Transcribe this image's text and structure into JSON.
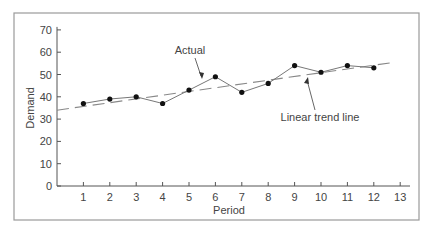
{
  "chart_data": {
    "type": "line",
    "title": "",
    "xlabel": "Period",
    "ylabel": "Demand",
    "xlim": [
      0,
      13
    ],
    "ylim": [
      0,
      70
    ],
    "x_ticks": [
      1,
      2,
      3,
      4,
      5,
      6,
      7,
      8,
      9,
      10,
      11,
      12,
      13
    ],
    "y_ticks": [
      0,
      10,
      20,
      30,
      40,
      50,
      60,
      70
    ],
    "grid": false,
    "legend": null,
    "series": [
      {
        "name": "Actual",
        "style": "solid-with-markers",
        "x": [
          1,
          2,
          3,
          4,
          5,
          6,
          7,
          8,
          9,
          10,
          11,
          12
        ],
        "values": [
          37,
          39,
          40,
          37,
          43,
          49,
          42,
          46,
          54,
          51,
          54,
          53
        ]
      },
      {
        "name": "Linear trend line",
        "style": "dashed",
        "x": [
          0,
          12.8
        ],
        "values": [
          34,
          55.5
        ]
      }
    ],
    "annotations": [
      {
        "text": "Actual",
        "points_to": "Actual series near period 5-6"
      },
      {
        "text": "Linear trend line",
        "points_to": "Trend line near period 9"
      }
    ]
  },
  "colors": {
    "frame": "#9a9a9a",
    "axis": "#555555",
    "actual_line": "#777777",
    "trend_line": "#888888",
    "marker": "#111111",
    "text": "#444444"
  }
}
